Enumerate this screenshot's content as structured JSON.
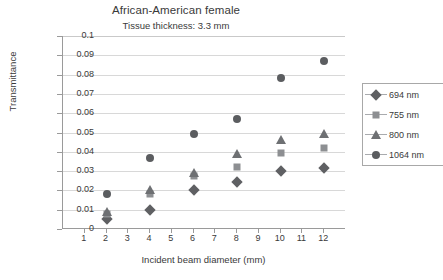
{
  "chart_data": {
    "type": "scatter",
    "title": "African-American female",
    "subtitle": "Tissue thickness: 3.3 mm",
    "xlabel": "Incident beam diameter (mm)",
    "ylabel": "Transmittance",
    "xlim": [
      0,
      13
    ],
    "ylim": [
      0,
      0.1
    ],
    "xticks": [
      1,
      2,
      3,
      4,
      5,
      6,
      7,
      8,
      9,
      10,
      11,
      12
    ],
    "yticks": [
      "0",
      "0.01",
      "0.02",
      "0.03",
      "0.04",
      "0.05",
      "0.06",
      "0.07",
      "0.08",
      "0.09",
      "0.1"
    ],
    "ytick_values": [
      0,
      0.01,
      0.02,
      0.03,
      0.04,
      0.05,
      0.06,
      0.07,
      0.08,
      0.09,
      0.1
    ],
    "grid": "horizontal",
    "legend_position": "right",
    "x": [
      2,
      4,
      6,
      8,
      10,
      12
    ],
    "series": [
      {
        "name": "694 nm",
        "marker": "diamond",
        "color": "#5f6063",
        "values": [
          0.005,
          0.01,
          0.02,
          0.0245,
          0.03,
          0.0315
        ]
      },
      {
        "name": "755 nm",
        "marker": "square",
        "color": "#8d8f92",
        "values": [
          0.008,
          0.018,
          0.0275,
          0.032,
          0.0395,
          0.042
        ]
      },
      {
        "name": "800 nm",
        "marker": "triangle",
        "color": "#6e7073",
        "values": [
          0.009,
          0.02,
          0.029,
          0.039,
          0.046,
          0.049
        ]
      },
      {
        "name": "1064 nm",
        "marker": "circle",
        "color": "#5b5d60",
        "values": [
          0.018,
          0.037,
          0.049,
          0.057,
          0.078,
          0.087
        ]
      }
    ]
  }
}
